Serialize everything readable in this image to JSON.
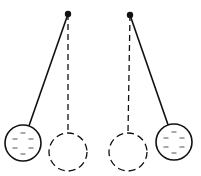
{
  "diagram": {
    "title": "",
    "colors": {
      "stroke": "#111111",
      "background": "#ffffff"
    },
    "pendulums": [
      {
        "name": "left",
        "pivot": [
          68,
          14
        ],
        "ball": {
          "cx": 23,
          "cy": 143,
          "r": 18,
          "charge": "negative"
        },
        "rest": {
          "cx": 68,
          "cy": 152,
          "r": 19
        }
      },
      {
        "name": "right",
        "pivot": [
          130,
          15
        ],
        "ball": {
          "cx": 174,
          "cy": 142,
          "r": 18,
          "charge": "negative"
        },
        "rest": {
          "cx": 128,
          "cy": 152,
          "r": 19
        }
      }
    ]
  }
}
